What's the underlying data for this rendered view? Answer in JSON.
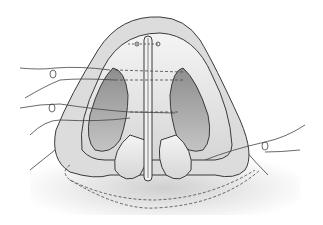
{
  "figure": {
    "colors": {
      "background": "#ffffff",
      "skin": "#d9d9d9",
      "skin_light": "#ececec",
      "cartilage": "#e8e8e8",
      "cavity": "#a9a9a9",
      "cavity_dark": "#8a8a8a",
      "outline": "#3a3a3a",
      "suture": "#444444"
    }
  }
}
